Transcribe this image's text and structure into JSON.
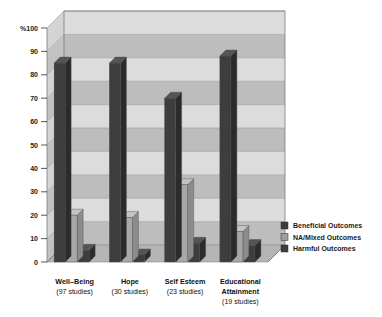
{
  "chart_data": {
    "type": "bar",
    "title": "",
    "subtitle": "",
    "xlabel": "",
    "ylabel": "%",
    "ylim": [
      0,
      100
    ],
    "yticks": [
      "%100",
      "90",
      "80",
      "70",
      "60",
      "50",
      "40",
      "30",
      "20",
      "10",
      "0"
    ],
    "ytick_values": [
      100,
      90,
      80,
      70,
      60,
      50,
      40,
      30,
      20,
      10,
      0
    ],
    "grid": true,
    "legend_position": "right",
    "three_d": true,
    "categories": [
      "Well-Being",
      "Hope",
      "Self Esteem",
      "Educational Attainment"
    ],
    "category_sublabels": [
      "(97 studies)",
      "(30 studies)",
      "(23 studies)",
      "(19 studies)"
    ],
    "series": [
      {
        "name": "Beneficial Outcomes",
        "color": "#3d3d3d",
        "values": [
          85,
          85,
          70,
          88
        ]
      },
      {
        "name": "NA/Mixed Outcomes",
        "color": "#a8a8a8",
        "values": [
          20,
          19,
          33,
          13
        ]
      },
      {
        "name": "Harmful Outcomes",
        "color": "#3d3d3d",
        "values": [
          5,
          3,
          8,
          7
        ]
      }
    ]
  },
  "legend": {
    "items": [
      {
        "label": "Beneficial Outcomes",
        "color": "#3d3d3d"
      },
      {
        "label": "NA/Mixed Outcomes",
        "color": "#9e9e9e"
      },
      {
        "label": "Harmful Outcomes",
        "color": "#3d3d3d"
      }
    ]
  },
  "axis": {
    "y_unit_label": "%100",
    "ticks": [
      "%100",
      "90",
      "80",
      "70",
      "60",
      "50",
      "40",
      "30",
      "20",
      "10",
      "0"
    ]
  },
  "colors": {
    "band_light": "#dcdcdc",
    "band_dark": "#bdbdbd",
    "wall_side": "#c9c9c9",
    "floor": "#b5b5b5",
    "bar_dark": "#3d3d3d",
    "bar_dark_side": "#2b2b2b",
    "bar_dark_top": "#555555",
    "bar_mid": "#a8a8a8",
    "bar_mid_side": "#8c8c8c",
    "bar_mid_top": "#c4c4c4",
    "gridline": "#9a9a9a",
    "text": "#1a1a1a"
  }
}
